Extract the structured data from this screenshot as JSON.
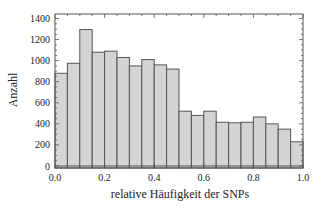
{
  "chart_data": {
    "type": "bar",
    "subtype": "histogram",
    "title": "",
    "xlabel": "relative Häufigkeit der SNPs",
    "ylabel": "Anzahl",
    "xlim": [
      0.0,
      1.0
    ],
    "ylim": [
      0,
      1440
    ],
    "x_ticks": [
      "0.0",
      "0.2",
      "0.4",
      "0.6",
      "0.8",
      "1.0"
    ],
    "y_ticks": [
      "0",
      "200",
      "400",
      "600",
      "800",
      "1000",
      "1200",
      "1400"
    ],
    "bin_width": 0.05,
    "bin_edges": [
      0.0,
      0.05,
      0.1,
      0.15,
      0.2,
      0.25,
      0.3,
      0.35,
      0.4,
      0.45,
      0.5,
      0.55,
      0.6,
      0.65,
      0.7,
      0.75,
      0.8,
      0.85,
      0.9,
      0.95,
      1.0
    ],
    "values": [
      880,
      975,
      1295,
      1080,
      1090,
      1030,
      950,
      1010,
      960,
      920,
      520,
      480,
      520,
      415,
      410,
      415,
      465,
      400,
      350,
      230
    ],
    "grid": false,
    "legend": null,
    "colors": {
      "bar_fill": "#d4d4d4",
      "bar_edge": "#555555",
      "frame": "#555555",
      "text": "#222222"
    }
  }
}
